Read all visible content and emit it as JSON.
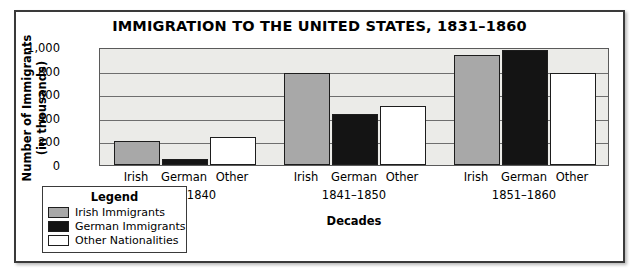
{
  "chart_data": {
    "type": "bar",
    "title": "IMMIGRATION TO THE UNITED STATES, 1831–1860",
    "xlabel": "Decades",
    "ylabel_line1": "Number of Immigrants",
    "ylabel_line2": "(in thousands)",
    "categories": [
      "1831–1840",
      "1841–1850",
      "1851–1860"
    ],
    "group_tick_labels": [
      "Irish",
      "German",
      "Other"
    ],
    "series": [
      {
        "name": "Irish Immigrants",
        "color": "#a8a8a8",
        "values": [
          200,
          780,
          930
        ]
      },
      {
        "name": "German Immigrants",
        "color": "#141414",
        "values": [
          50,
          430,
          975
        ]
      },
      {
        "name": "Other Nationalities",
        "color": "#ffffff",
        "values": [
          240,
          500,
          780
        ]
      }
    ],
    "ylim": [
      0,
      1000
    ],
    "yticks": [
      0,
      200,
      400,
      600,
      800,
      1000
    ],
    "ytick_labels": [
      "0",
      "200",
      "400",
      "600",
      "800",
      "1,000"
    ],
    "grid": true,
    "legend_position": "bottom-left",
    "plot_background": "#ebebe8",
    "bar_border_color": "#1d1d1d"
  },
  "legend": {
    "title": "Legend",
    "entries": [
      {
        "label": "Irish Immigrants",
        "swatch": "irish"
      },
      {
        "label": "German Immigrants",
        "swatch": "german"
      },
      {
        "label": "Other Nationalities",
        "swatch": "other"
      }
    ]
  }
}
